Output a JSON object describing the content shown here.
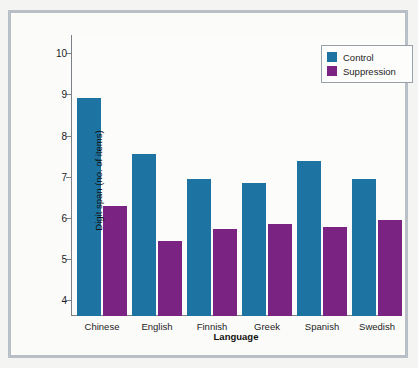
{
  "chart_data": {
    "type": "bar",
    "title": "",
    "xlabel": "Language",
    "ylabel": "Digit span (no. of items)",
    "categories": [
      "Chinese",
      "English",
      "Finnish",
      "Greek",
      "Spanish",
      "Swedish"
    ],
    "series": [
      {
        "name": "Control",
        "color": "#1d74a3",
        "values": [
          8.92,
          7.55,
          6.94,
          6.85,
          7.37,
          6.93
        ]
      },
      {
        "name": "Suppression",
        "color": "#7b2382",
        "values": [
          6.29,
          5.42,
          5.71,
          5.85,
          5.77,
          5.93
        ]
      }
    ],
    "ylim": [
      3.6,
      10.45
    ],
    "yticks": [
      4,
      5,
      6,
      7,
      8,
      9,
      10
    ],
    "ytick_labels": [
      "4",
      "5",
      "6",
      "7",
      "8",
      "9",
      "10"
    ],
    "grid": false,
    "legend_position": "top-right"
  },
  "legend": {
    "entries": [
      {
        "label": "Control"
      },
      {
        "label": "Suppression"
      }
    ]
  },
  "axes": {
    "x_title": "Language",
    "y_title": "Digit span (no. of items)"
  },
  "background_text": {
    "lines": [
      "and the results showed a reliable effect of articulatory",
      "suppression on the digit span measured across the six",
      "language groups tested in the present experiment, with",
      "the largest reduction observed for the Chinese speakers",
      "whose baseline span was also the highest of the sample.",
      "Comparable patterns have been reported previously in",
      "studies of the phonological loop and word length effects",
      "across languages with differing articulation rates, and",
      "these data extend that literature to a larger set of",
      "languages than had been examined in earlier reports."
    ]
  }
}
